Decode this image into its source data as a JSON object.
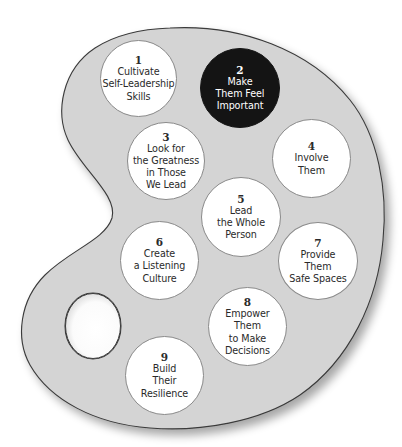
{
  "diagram": {
    "type": "artist-palette",
    "colors": {
      "background": "#ffffff",
      "palette_fill": "#d4d4d4",
      "palette_outline": "#3a3a3a",
      "circle_fill": "#ffffff",
      "circle_highlight_fill": "#141414",
      "text_dark": "#2a2a2a",
      "text_light": "#ffffff"
    },
    "steps": [
      {
        "number": "1",
        "lines": [
          "Cultivate",
          "Self-Leadership",
          "Skills"
        ],
        "highlighted": false
      },
      {
        "number": "2",
        "lines": [
          "Make",
          "Them Feel",
          "Important"
        ],
        "highlighted": true
      },
      {
        "number": "3",
        "lines": [
          "Look for",
          "the Greatness",
          "in Those",
          "We Lead"
        ],
        "highlighted": false
      },
      {
        "number": "4",
        "lines": [
          "Involve",
          "Them"
        ],
        "highlighted": false
      },
      {
        "number": "5",
        "lines": [
          "Lead",
          "the Whole",
          "Person"
        ],
        "highlighted": false
      },
      {
        "number": "6",
        "lines": [
          "Create",
          "a Listening",
          "Culture"
        ],
        "highlighted": false
      },
      {
        "number": "7",
        "lines": [
          "Provide",
          "Them",
          "Safe Spaces"
        ],
        "highlighted": false
      },
      {
        "number": "8",
        "lines": [
          "Empower",
          "Them",
          "to Make",
          "Decisions"
        ],
        "highlighted": false
      },
      {
        "number": "9",
        "lines": [
          "Build",
          "Their",
          "Resilience"
        ],
        "highlighted": false
      }
    ]
  }
}
